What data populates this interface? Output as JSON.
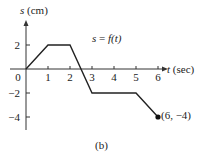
{
  "chart_data": {
    "type": "line",
    "title": "s = f(t)",
    "caption": "(b)",
    "xlabel_var": "t",
    "xlabel_unit": "(sec)",
    "ylabel_var": "s",
    "ylabel_unit": "(cm)",
    "x_ticks": [
      0,
      1,
      2,
      3,
      4,
      5,
      6
    ],
    "y_ticks": [
      2,
      -2,
      -4
    ],
    "xlim": [
      0,
      6
    ],
    "ylim": [
      -4,
      2
    ],
    "grid": false,
    "series": [
      {
        "name": "s = f(t)",
        "x": [
          0,
          1,
          2,
          3,
          5,
          6
        ],
        "y": [
          0,
          2,
          2,
          -2,
          -2,
          -4
        ]
      }
    ],
    "annotations": [
      {
        "text": "(6, −4)",
        "x": 6,
        "y": -4,
        "marker": "filled-dot"
      }
    ]
  },
  "labels": {
    "y_axis": "(cm)",
    "y_var": "s",
    "x_var": "t",
    "x_axis": "(sec)",
    "function_lhs": "s",
    "function_eq": " = ",
    "function_rhs": "f(t)",
    "endpoint": "(6, −4)",
    "caption": "(b)",
    "origin": "0",
    "tick_x": [
      "1",
      "2",
      "3",
      "4",
      "5",
      "6"
    ],
    "tick_y": [
      "2",
      "−2",
      "−4"
    ]
  }
}
